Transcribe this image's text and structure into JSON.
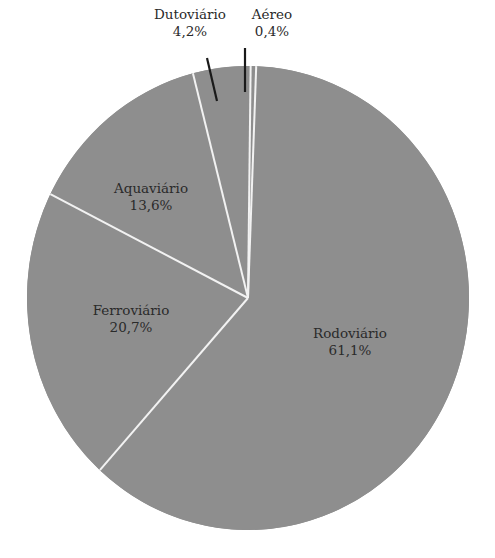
{
  "chart_data": {
    "type": "pie",
    "title": "",
    "start_angle_deg": 0,
    "direction": "clockwise",
    "slices": [
      {
        "label": "Aéreo",
        "value": 0.4,
        "display": "0,4%"
      },
      {
        "label": "Rodoviário",
        "value": 61.1,
        "display": "61,1%"
      },
      {
        "label": "Ferroviário",
        "value": 20.7,
        "display": "20,7%"
      },
      {
        "label": "Aquaviário",
        "value": 13.6,
        "display": "13,6%"
      },
      {
        "label": "Dutoviário",
        "value": 4.2,
        "display": "4,2%"
      }
    ],
    "colors": {
      "fill": "#8e8e8e",
      "separator": "#f2f2f2",
      "leader": "#1a1a1a",
      "text": "#2a2a2a"
    },
    "legend": "none"
  },
  "labels": {
    "aereo": {
      "name": "Aéreo",
      "pct": "0,4%"
    },
    "rodoviario": {
      "name": "Rodoviário",
      "pct": "61,1%"
    },
    "ferroviario": {
      "name": "Ferroviário",
      "pct": "20,7%"
    },
    "aquaviario": {
      "name": "Aquaviário",
      "pct": "13,6%"
    },
    "dutoviario": {
      "name": "Dutoviário",
      "pct": "4,2%"
    }
  }
}
